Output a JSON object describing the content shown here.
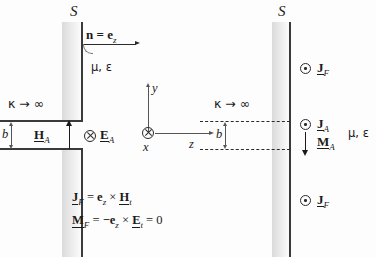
{
  "figure": {
    "title_left": "Original problem with aperture in perfect conductor",
    "title_right": "Equivalent problem with equivalent sources"
  },
  "left_diagram": {
    "surface_label": "S",
    "normal_label": "n = e",
    "normal_sub": "z",
    "medium_label": "μ, ε",
    "conductivity_label": "κ → ∞",
    "aperture_height_label": "b",
    "h_field_label": "H",
    "h_field_sub": "A",
    "e_field_label": "E",
    "e_field_sub": "A",
    "e_field_symbol": "cross-in-circle",
    "axes": {
      "y_label": "y",
      "x_label": "x",
      "z_label": "z",
      "x_symbol": "cross-in-circle"
    }
  },
  "right_diagram": {
    "surface_label": "S",
    "medium_label": "μ, ε",
    "conductivity_label": "κ → ∞",
    "aperture_height_label": "b",
    "sources": [
      {
        "symbol": "dot-in-circle",
        "label": "J",
        "sub": "F"
      },
      {
        "symbol": "dot-in-circle",
        "label": "J",
        "sub": "A"
      },
      {
        "symbol": "down-arrow",
        "label": "M",
        "sub": "A"
      },
      {
        "symbol": "dot-in-circle",
        "label": "J",
        "sub": "F"
      }
    ]
  },
  "equations": [
    {
      "lhs_bold": "J",
      "lhs_sub": "F",
      "eq": "=",
      "rhs": "e",
      "rhs_sub": "z",
      "op": "×",
      "rhs2": "H",
      "rhs2_sub": "t",
      "tail": "",
      "full": "J_F = e_z × H_t"
    },
    {
      "lhs_bold": "M",
      "lhs_sub": "F",
      "eq": "=",
      "rhs": "−e",
      "rhs_sub": "z",
      "op": "×",
      "rhs2": "E",
      "rhs2_sub": "t",
      "tail": "= 0",
      "full": "M_F = −e_z × E_t = 0"
    }
  ],
  "glyphs": {
    "times": "×",
    "equals": "=",
    "minus": "−",
    "zero": "0",
    "arrow_right": "→",
    "infinity": "∞",
    "kappa": "κ",
    "mu": "μ",
    "epsilon": "ε"
  },
  "colors": {
    "ink": "#1a1a1a",
    "wall": "#3a3a3a",
    "thin": "#555555",
    "background": "#fdfdfd"
  }
}
